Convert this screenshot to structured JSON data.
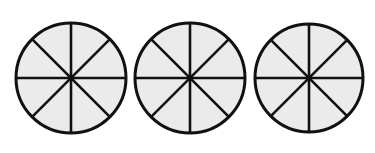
{
  "diagram": {
    "fill_color": "#ebebeb",
    "stroke_color": "#111111",
    "stroke_width": 2.6,
    "divisions": 8,
    "circles": [
      {
        "cx": 71,
        "cy": 78,
        "r": 55,
        "shaded_parts": 0
      },
      {
        "cx": 190,
        "cy": 78,
        "r": 55,
        "shaded_parts": 0
      },
      {
        "cx": 309,
        "cy": 78,
        "r": 54,
        "shaded_parts": 0
      }
    ]
  }
}
